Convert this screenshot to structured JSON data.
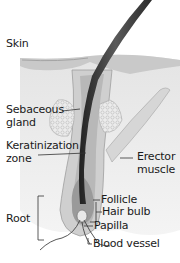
{
  "diagram": {
    "labels": {
      "skin": "Skin",
      "sebaceous_gland_1": "Sebaceous",
      "sebaceous_gland_2": "gland",
      "keratinization_1": "Keratinization",
      "keratinization_2": "zone",
      "erector_1": "Erector",
      "erector_2": "muscle",
      "follicle": "Follicle",
      "hair_bulb": "Hair bulb",
      "papilla": "Papilla",
      "root": "Root",
      "blood_vessel": "Blood vessel"
    },
    "colors": {
      "background": "#ffffff",
      "skin_layer": "#d9d9d9",
      "epidermis": "#c8c8c8",
      "follicle": "#bdbdbd",
      "hair_shaft": "#3a3a3a",
      "gland": "#e6e6e6",
      "label_text": "#1a1a1a",
      "leader_line": "#333333"
    }
  }
}
